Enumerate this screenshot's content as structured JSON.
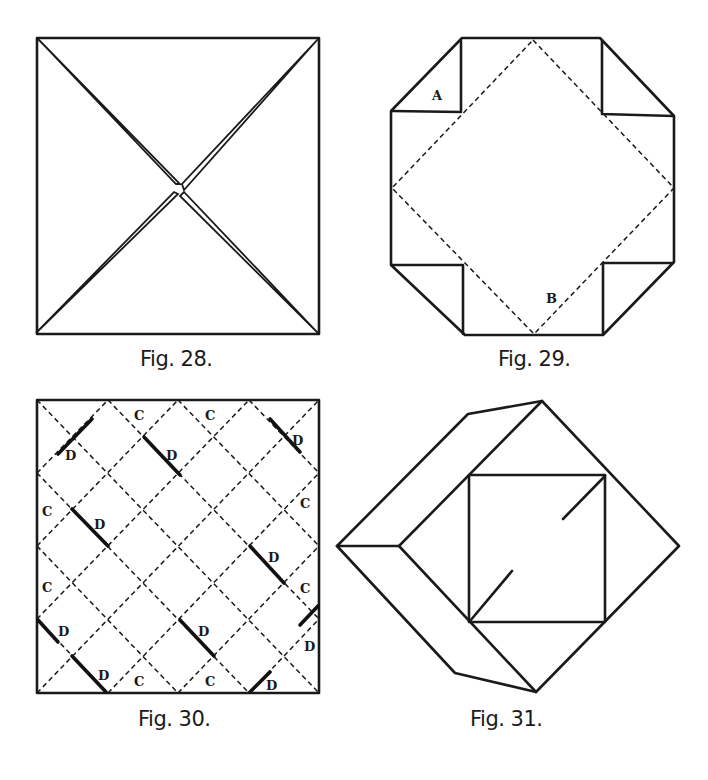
{
  "figures": [
    {
      "id": "fig28",
      "caption": "Fig. 28."
    },
    {
      "id": "fig29",
      "caption": "Fig. 29.",
      "labels": {
        "a": "A",
        "b": "B"
      }
    },
    {
      "id": "fig30",
      "caption": "Fig. 30.",
      "labels": {
        "c": "C",
        "d": "D"
      }
    },
    {
      "id": "fig31",
      "caption": "Fig. 31."
    }
  ],
  "colors": {
    "ink": "#1a1a1a",
    "paper": "#ffffff"
  }
}
